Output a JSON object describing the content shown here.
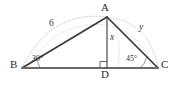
{
  "figure": {
    "type": "geometry-triangle-diagram",
    "background_color": "#ffffff",
    "stroke_color": "#3a3a3a",
    "base_color": "#555555",
    "dotted_color": "#b9b9b9"
  },
  "vertices": {
    "A": {
      "label": "A",
      "x": 107,
      "y": 17,
      "label_x": 103,
      "label_y": 4
    },
    "B": {
      "label": "B",
      "x": 22,
      "y": 68,
      "label_x": 11,
      "label_y": 61
    },
    "C": {
      "label": "C",
      "x": 158,
      "y": 68,
      "label_x": 162,
      "label_y": 61
    },
    "D": {
      "label": "D",
      "x": 107,
      "y": 68,
      "label_x": 103,
      "label_y": 71
    }
  },
  "side_labels": {
    "ab": {
      "text": "6",
      "x": 50,
      "y": 22
    },
    "altitude": {
      "text": "x",
      "x": 111,
      "y": 36
    },
    "ac": {
      "text": "y",
      "x": 140,
      "y": 26
    }
  },
  "angle_labels": {
    "at_b": {
      "text": "30°",
      "x": 33,
      "y": 57
    },
    "at_c": {
      "text": "45°",
      "x": 127,
      "y": 57
    }
  },
  "markers": {
    "right_angle_at_d": "right-angle-square"
  }
}
